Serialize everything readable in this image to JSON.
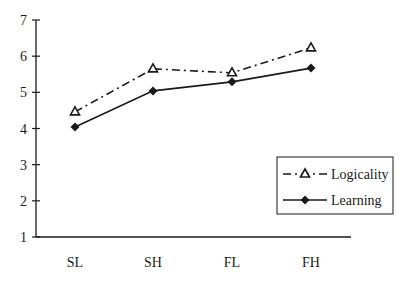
{
  "chart_data": {
    "type": "line",
    "title": "",
    "xlabel": "",
    "ylabel": "",
    "categories": [
      "SL",
      "SH",
      "FL",
      "FH"
    ],
    "ylim": [
      1,
      7
    ],
    "yticks": [
      1,
      2,
      3,
      4,
      5,
      6,
      7
    ],
    "grid": false,
    "legend_position": "lower right",
    "series": [
      {
        "name": "Logicality",
        "values": [
          4.46,
          5.65,
          5.54,
          6.23
        ],
        "marker": "open-triangle",
        "line_style": "dash-dot"
      },
      {
        "name": "Learning",
        "values": [
          4.04,
          5.04,
          5.29,
          5.67
        ],
        "marker": "filled-diamond",
        "line_style": "solid"
      }
    ]
  },
  "colors": {
    "axis": "#1a1a1a",
    "line": "#1a1a1a",
    "background": "#ffffff"
  }
}
